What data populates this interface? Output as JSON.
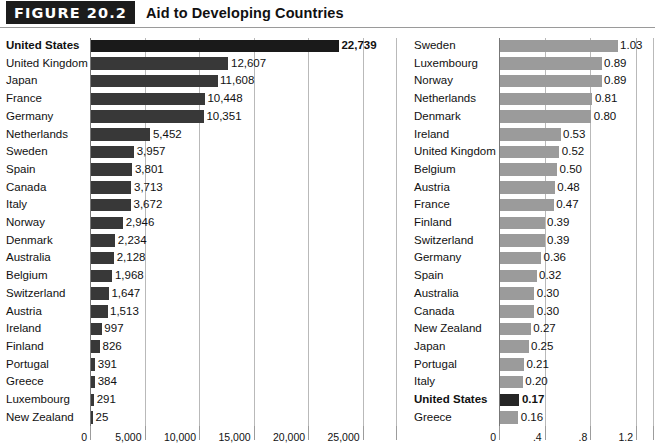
{
  "header": {
    "badge_label": "FIGURE 20.2",
    "title": "Aid to Developing Countries"
  },
  "chart_data": [
    {
      "id": "left",
      "type": "bar",
      "orientation": "horizontal",
      "title": "Aid to Developing Countries",
      "subtitle": "Total aid (millions of dollars)",
      "xlabel": "",
      "ylabel": "",
      "xlim": [
        0,
        26500
      ],
      "grid": true,
      "legend": "none",
      "tick_labels": [
        "0",
        "5,000",
        "10,000",
        "15,000",
        "20,000",
        "25,000"
      ],
      "tick_values": [
        0,
        5000,
        10000,
        15000,
        20000,
        25000
      ],
      "bar_color": "#383838",
      "highlight_color": "#1a1a1a",
      "categories": [
        "United States",
        "United Kingdom",
        "Japan",
        "France",
        "Germany",
        "Netherlands",
        "Sweden",
        "Spain",
        "Canada",
        "Italy",
        "Norway",
        "Denmark",
        "Australia",
        "Belgium",
        "Switzerland",
        "Austria",
        "Ireland",
        "Finland",
        "Portugal",
        "Greece",
        "Luxembourg",
        "New Zealand"
      ],
      "values": [
        22739,
        12607,
        11608,
        10448,
        10351,
        5452,
        3957,
        3801,
        3713,
        3672,
        2946,
        2234,
        2128,
        1968,
        1647,
        1513,
        997,
        826,
        391,
        384,
        291,
        25
      ],
      "value_labels": [
        "22,739",
        "12,607",
        "11,608",
        "10,448",
        "10,351",
        "5,452",
        "3,957",
        "3,801",
        "3,713",
        "3,672",
        "2,946",
        "2,234",
        "2,128",
        "1,968",
        "1,647",
        "1,513",
        "997",
        "826",
        "391",
        "384",
        "291",
        "25"
      ],
      "bold_categories": [
        "United States"
      ]
    },
    {
      "id": "right",
      "type": "bar",
      "orientation": "horizontal",
      "title": "Aid to Developing Countries",
      "subtitle": "Aid as percentage of gross national income",
      "xlabel": "",
      "ylabel": "",
      "xlim": [
        0,
        1.27
      ],
      "grid": true,
      "legend": "none",
      "tick_labels": [
        "0",
        ".4",
        ".8",
        "1.2"
      ],
      "tick_values": [
        0,
        0.4,
        0.8,
        1.2
      ],
      "bar_color": "#9b9b9b",
      "highlight_color": "#262626",
      "categories": [
        "Sweden",
        "Luxembourg",
        "Norway",
        "Netherlands",
        "Denmark",
        "Ireland",
        "United Kingdom",
        "Belgium",
        "Austria",
        "France",
        "Finland",
        "Switzerland",
        "Germany",
        "Spain",
        "Australia",
        "Canada",
        "New Zealand",
        "Japan",
        "Portugal",
        "Italy",
        "United States",
        "Greece"
      ],
      "values": [
        1.03,
        0.89,
        0.89,
        0.81,
        0.8,
        0.53,
        0.52,
        0.5,
        0.48,
        0.47,
        0.39,
        0.39,
        0.36,
        0.32,
        0.3,
        0.3,
        0.27,
        0.25,
        0.21,
        0.2,
        0.17,
        0.16
      ],
      "value_labels": [
        "1.03",
        "0.89",
        "0.89",
        "0.81",
        "0.80",
        "0.53",
        "0.52",
        "0.50",
        "0.48",
        "0.47",
        "0.39",
        "0.39",
        "0.36",
        "0.32",
        "0.30",
        "0.30",
        "0.27",
        "0.25",
        "0.21",
        "0.20",
        "0.17",
        "0.16"
      ],
      "bold_categories": [
        "United States"
      ]
    }
  ],
  "layout": {
    "row_height": 17.7,
    "bar_height": 12.5,
    "plot_top": 5,
    "left_panel": {
      "label_right": 88,
      "axis_x": 90,
      "plot_width": 289
    },
    "right_panel": {
      "label_right": 88,
      "axis_x": 91,
      "plot_width": 145
    }
  }
}
